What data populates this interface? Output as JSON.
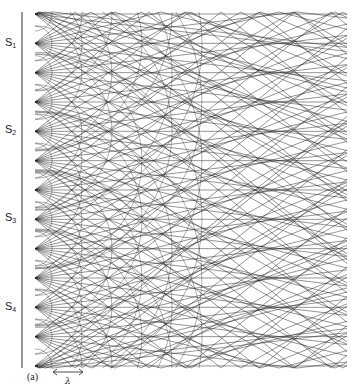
{
  "figure": {
    "caption": "(a)",
    "wavelength_symbol": "λ",
    "source_labels": [
      {
        "text": "S",
        "sub": "1",
        "y": 43
      },
      {
        "text": "S",
        "sub": "2",
        "y": 130
      },
      {
        "text": "S",
        "sub": "3",
        "y": 218
      },
      {
        "text": "S",
        "sub": "4",
        "y": 307
      }
    ],
    "line_color": "#1a1a1a",
    "axis_line": {
      "x": 22,
      "y_top": 12,
      "y_bottom": 368
    },
    "field": {
      "x_left": 35,
      "x_right": 347,
      "y_top": 12,
      "y_bottom": 368
    },
    "sources": {
      "x": 35,
      "y_start": 14,
      "spacing": 29.33,
      "count": 13
    },
    "ray_slopes": [
      0.0,
      0.12,
      0.25,
      0.4,
      0.58,
      0.8,
      -0.12,
      -0.25,
      -0.4,
      -0.58,
      -0.8
    ],
    "arc_radii": [
      17,
      47,
      77,
      107,
      137,
      167
    ],
    "lambda_arrow": {
      "x1": 53,
      "x2": 83,
      "y": 372
    }
  }
}
